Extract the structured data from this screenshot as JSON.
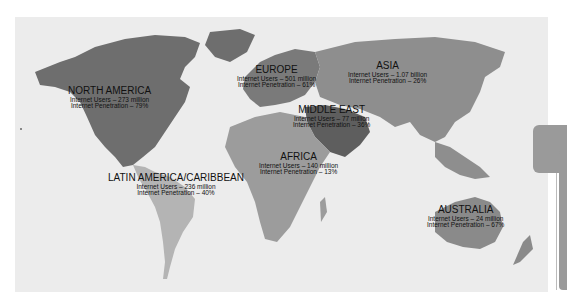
{
  "map": {
    "title": "World Internet Usage by Region",
    "colors": {
      "background": "#ececec",
      "north_america": "#6e6e6e",
      "europe": "#7a7a7a",
      "asia": "#8e8e8e",
      "middle_east": "#5e5e5e",
      "africa": "#9c9c9c",
      "latin_america": "#b4b4b4",
      "australia": "#8a8a8a"
    },
    "regions": [
      {
        "name": "NORTH AMERICA",
        "users": "Internet Users – 273 million",
        "penetration": "Internet Penetration – 79%"
      },
      {
        "name": "EUROPE",
        "users": "Internet Users – 501 million",
        "penetration": "Internet Penetration – 61%"
      },
      {
        "name": "ASIA",
        "users": "Internet Users – 1.07 billion",
        "penetration": "Internet Penetration – 26%"
      },
      {
        "name": "MIDDLE EAST",
        "users": "Internet Users – 77 million",
        "penetration": "Internet Penetration – 36%"
      },
      {
        "name": "AFRICA",
        "users": "Internet Users – 140 million",
        "penetration": "Internet Penetration – 13%"
      },
      {
        "name": "LATIN AMERICA/CARIBBEAN",
        "users": "Internet Users – 236 million",
        "penetration": "Internet Penetration – 40%"
      },
      {
        "name": "AUSTRALIA",
        "users": "Internet Users – 24 million",
        "penetration": "Internet Penetration – 67%"
      }
    ]
  }
}
